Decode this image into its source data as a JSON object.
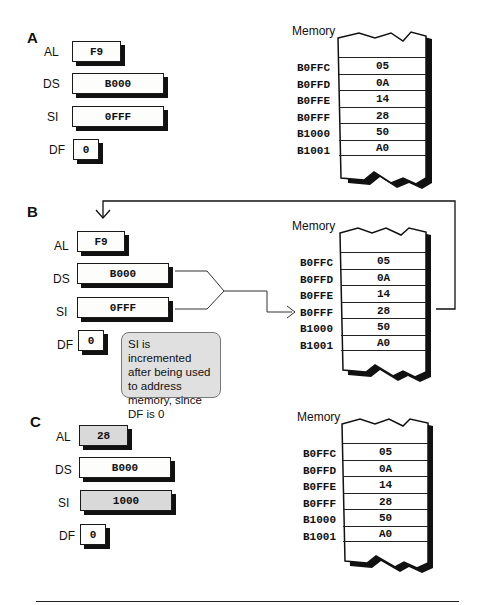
{
  "sections": [
    {
      "id": "A",
      "label": "A",
      "registers": {
        "AL": {
          "label": "AL",
          "value": "F9",
          "changed": false
        },
        "DS": {
          "label": "DS",
          "value": "B000",
          "changed": false
        },
        "SI": {
          "label": "SI",
          "value": "0FFF",
          "changed": false
        },
        "DF": {
          "label": "DF",
          "value": "0",
          "changed": false
        }
      },
      "memory": {
        "title": "Memory",
        "rows": [
          {
            "address": "B0FFC",
            "value": "05"
          },
          {
            "address": "B0FFD",
            "value": "0A"
          },
          {
            "address": "B0FFE",
            "value": "14"
          },
          {
            "address": "B0FFF",
            "value": "28"
          },
          {
            "address": "B1000",
            "value": "50"
          },
          {
            "address": "B1001",
            "value": "A0"
          }
        ]
      }
    },
    {
      "id": "B",
      "label": "B",
      "registers": {
        "AL": {
          "label": "AL",
          "value": "F9",
          "changed": false
        },
        "DS": {
          "label": "DS",
          "value": "B000",
          "changed": false
        },
        "SI": {
          "label": "SI",
          "value": "0FFF",
          "changed": false
        },
        "DF": {
          "label": "DF",
          "value": "0",
          "changed": false
        }
      },
      "memory": {
        "title": "Memory",
        "rows": [
          {
            "address": "B0FFC",
            "value": "05"
          },
          {
            "address": "B0FFD",
            "value": "0A"
          },
          {
            "address": "B0FFE",
            "value": "14"
          },
          {
            "address": "B0FFF",
            "value": "28"
          },
          {
            "address": "B1000",
            "value": "50"
          },
          {
            "address": "B1001",
            "value": "A0"
          }
        ],
        "pointed_address": "B0FFF"
      },
      "note": "SI is incremented after being used to address memory, since DF is 0"
    },
    {
      "id": "C",
      "label": "C",
      "registers": {
        "AL": {
          "label": "AL",
          "value": "28",
          "changed": true
        },
        "DS": {
          "label": "DS",
          "value": "B000",
          "changed": false
        },
        "SI": {
          "label": "SI",
          "value": "1000",
          "changed": true
        },
        "DF": {
          "label": "DF",
          "value": "0",
          "changed": false
        }
      },
      "memory": {
        "title": "Memory",
        "rows": [
          {
            "address": "B0FFC",
            "value": "05"
          },
          {
            "address": "B0FFD",
            "value": "0A"
          },
          {
            "address": "B0FFE",
            "value": "14"
          },
          {
            "address": "B0FFF",
            "value": "28"
          },
          {
            "address": "B1000",
            "value": "50"
          },
          {
            "address": "B1001",
            "value": "A0"
          }
        ]
      }
    }
  ],
  "colors": {
    "changed_register_fill": "#d9d9d9",
    "note_fill": "#e0e0e0",
    "ink": "#111111"
  }
}
